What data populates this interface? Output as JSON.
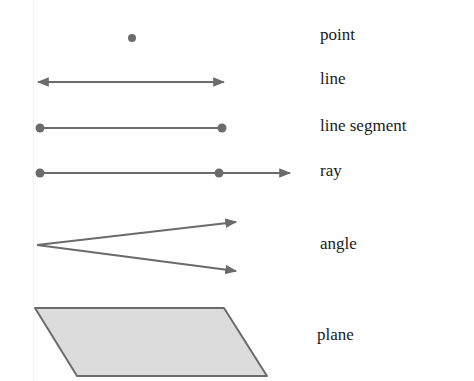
{
  "colors": {
    "stroke": "#6b6b6b",
    "fill_plane": "#dcdcdc",
    "text": "#1a1a1a",
    "background": "#ffffff"
  },
  "figures": [
    {
      "id": "point",
      "label": "point"
    },
    {
      "id": "line",
      "label": "line"
    },
    {
      "id": "line-segment",
      "label": "line segment"
    },
    {
      "id": "ray",
      "label": "ray"
    },
    {
      "id": "angle",
      "label": "angle"
    },
    {
      "id": "plane",
      "label": "plane"
    }
  ]
}
